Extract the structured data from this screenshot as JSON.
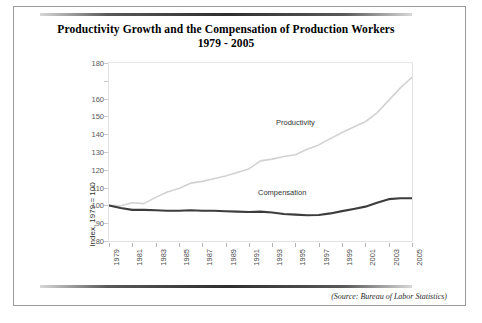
{
  "document": {
    "source_note": "(Source: Bureau of Labor Statistics)"
  },
  "chart_data": {
    "type": "line",
    "title_line1": "Productivity Growth and the Compensation of Production Workers",
    "title_line2": "1979 - 2005",
    "xlabel": "",
    "ylabel": "Index, 1979 = 100",
    "ylim": [
      80,
      180
    ],
    "xlim": [
      1979,
      2005
    ],
    "grid": false,
    "legend_position": "inline-annotation",
    "ytick_labels": [
      "180",
      "",
      "160",
      "150",
      "140",
      "130",
      "120",
      "110",
      "100",
      "90",
      "80"
    ],
    "yticks": [
      180,
      170,
      160,
      150,
      140,
      130,
      120,
      110,
      100,
      90,
      80
    ],
    "xtick_labels": [
      "1979",
      "1981",
      "1983",
      "1985",
      "1987",
      "1989",
      "1991",
      "1993",
      "1995",
      "1997",
      "1999",
      "2001",
      "2003",
      "2005"
    ],
    "xticks": [
      1979,
      1981,
      1983,
      1985,
      1987,
      1989,
      1991,
      1993,
      1995,
      1997,
      1999,
      2001,
      2003,
      2005
    ],
    "x": [
      1979,
      1980,
      1981,
      1982,
      1983,
      1984,
      1985,
      1986,
      1987,
      1988,
      1989,
      1990,
      1991,
      1992,
      1993,
      1994,
      1995,
      1996,
      1997,
      1998,
      1999,
      2000,
      2001,
      2002,
      2003,
      2004,
      2005
    ],
    "series": [
      {
        "name": "Productivity",
        "color": "#d2d2d2",
        "width": 1.6,
        "values": [
          100.0,
          99.8,
          101.5,
          101.0,
          104.5,
          107.5,
          109.5,
          112.5,
          113.5,
          115.0,
          116.5,
          118.5,
          120.5,
          125.0,
          126.0,
          127.5,
          128.5,
          131.5,
          134.0,
          137.5,
          141.0,
          144.0,
          147.0,
          152.0,
          159.0,
          166.0,
          172.0
        ]
      },
      {
        "name": "Compensation",
        "color": "#3c3c3c",
        "width": 2.1,
        "values": [
          100.0,
          98.5,
          97.5,
          97.5,
          97.3,
          97.0,
          97.0,
          97.3,
          97.0,
          97.0,
          96.7,
          96.5,
          96.3,
          96.5,
          96.0,
          95.2,
          94.8,
          94.5,
          94.6,
          95.5,
          96.8,
          98.0,
          99.3,
          101.5,
          103.5,
          104.0,
          104.0
        ]
      }
    ],
    "annotations": [
      {
        "text": "Productivity",
        "x": 1997,
        "y": 133
      },
      {
        "text": "Compensation",
        "x": 1995,
        "y": 100
      }
    ]
  }
}
